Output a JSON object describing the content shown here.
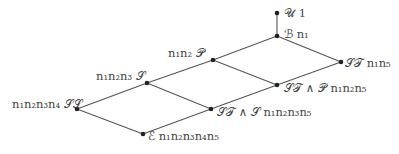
{
  "diagram": {
    "type": "lattice",
    "nodes": [
      {
        "id": "U",
        "symbol": "𝒰",
        "label": "1",
        "x": 277,
        "y": 13
      },
      {
        "id": "B",
        "symbol": "ℬ",
        "label": "n₁",
        "x": 277,
        "y": 36
      },
      {
        "id": "P",
        "symbol": "𝒫",
        "label": "n₁n₂",
        "x": 213,
        "y": 60
      },
      {
        "id": "ST",
        "symbol": "𝒮𝒯",
        "label": "n₁n₅",
        "x": 341,
        "y": 62
      },
      {
        "id": "S",
        "symbol": "𝒮",
        "label": "n₁n₂n₃",
        "x": 147,
        "y": 83
      },
      {
        "id": "STP",
        "symbol": "𝒮𝒯 ∧ 𝒫",
        "label": "n₁n₂n₅",
        "x": 277,
        "y": 85
      },
      {
        "id": "SS",
        "symbol": "𝒮𝒮",
        "label": "n₁n₂n₃n₄",
        "x": 77,
        "y": 109
      },
      {
        "id": "STS",
        "symbol": "𝒮𝒯 ∧ 𝒮",
        "label": "n₁n₂n₃n₅",
        "x": 211,
        "y": 109
      },
      {
        "id": "E",
        "symbol": "ℰ",
        "label": "n₁n₂n₃n₄n₅",
        "x": 143,
        "y": 134
      }
    ],
    "edges": [
      [
        "U",
        "B"
      ],
      [
        "B",
        "P"
      ],
      [
        "B",
        "ST"
      ],
      [
        "P",
        "S"
      ],
      [
        "P",
        "STP"
      ],
      [
        "ST",
        "STP"
      ],
      [
        "S",
        "SS"
      ],
      [
        "S",
        "STS"
      ],
      [
        "STP",
        "STS"
      ],
      [
        "SS",
        "E"
      ],
      [
        "STS",
        "E"
      ]
    ],
    "labels": {
      "U": "𝒰  1",
      "B": "ℬ  n₁",
      "P": "n₁n₂  𝒫",
      "ST": "𝒮𝒯  n₁n₅",
      "S": "n₁n₂n₃  𝒮",
      "STP": "𝒮𝒯 ∧ 𝒫  n₁n₂n₅",
      "SS": "n₁n₂n₃n₄  𝒮𝒮",
      "STS": "𝒮𝒯 ∧ 𝒮  n₁n₂n₃n₅",
      "E": "ℰ  n₁n₂n₃n₄n₅"
    }
  }
}
